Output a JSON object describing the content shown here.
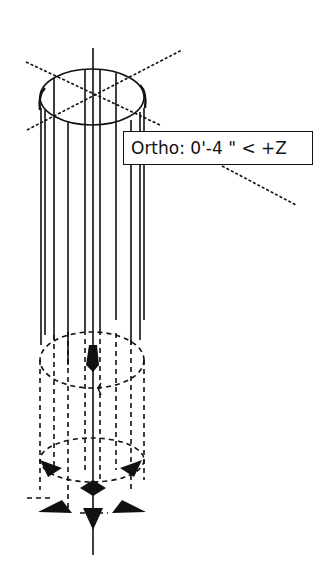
{
  "viewport": {
    "background": "#ffffff",
    "line_color": "#111111"
  },
  "tooltip": {
    "mode": "Ortho",
    "text": "Ortho: 0'-4 \" < +Z",
    "distance": "0'-4 \"",
    "direction": "+Z"
  },
  "icons": {
    "ucs_cursor": "crosshair-cursor-icon",
    "grip": "grip-arrow-icon"
  }
}
